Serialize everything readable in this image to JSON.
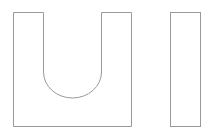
{
  "figure": {
    "letters": [
      "U",
      "I"
    ],
    "label": "UI",
    "stroke_color": "#999999",
    "fill_color": "#ffffff",
    "background": "#ffffff"
  }
}
